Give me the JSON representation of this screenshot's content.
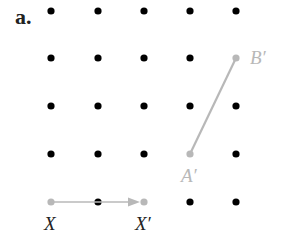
{
  "part_label": "a.",
  "grid": {
    "columns_x": [
      51,
      98,
      144,
      190,
      236
    ],
    "rows_y": [
      11,
      58,
      106,
      154,
      202
    ],
    "dot_color": "#000000"
  },
  "highlight_color": "#b8b8b8",
  "points": {
    "X": {
      "label": "X",
      "col": 0,
      "row": 4
    },
    "X_prime": {
      "label": "X′",
      "col": 2,
      "row": 4
    },
    "A_prime": {
      "label": "A′",
      "col": 3,
      "row": 3
    },
    "B_prime": {
      "label": "B′",
      "col": 4,
      "row": 1
    }
  },
  "vector": {
    "from": "X",
    "to": "X′"
  },
  "segment": {
    "from": "A′",
    "to": "B′"
  }
}
